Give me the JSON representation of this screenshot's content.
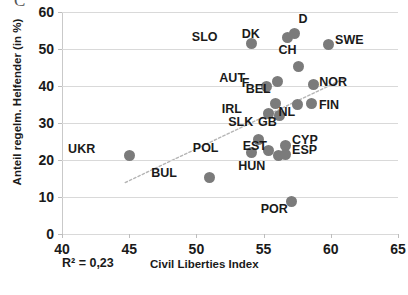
{
  "axes": {
    "y_title": "Anteil regelm. Helfender (in %)",
    "x_title": "Civil Liberties Index",
    "y_ticks": [
      "0",
      "10",
      "20",
      "30",
      "40",
      "50",
      "60"
    ],
    "x_ticks": [
      "40",
      "45",
      "50",
      "55",
      "60",
      "65"
    ]
  },
  "annotations": {
    "r2": "R² = 0,23"
  },
  "colors": {
    "marker": "#7b7b7b",
    "gridline": "#d9d9d9",
    "trendline": "#b5b5b5",
    "text": "#1a1a1a"
  },
  "chart_data": {
    "type": "scatter",
    "title": "",
    "xlabel": "Civil Liberties Index",
    "ylabel": "Anteil regelm. Helfender (in %)",
    "xlim": [
      40,
      65
    ],
    "ylim": [
      0,
      60
    ],
    "xticks": [
      40,
      45,
      50,
      55,
      60,
      65
    ],
    "yticks": [
      0,
      10,
      20,
      30,
      40,
      50,
      60
    ],
    "grid": "horizontal",
    "legend": "none",
    "annotations": [
      "R² = 0,23"
    ],
    "trendline": {
      "visible": true,
      "style": "dotted",
      "x_start": 44.7,
      "y_start": 13.9,
      "x_end": 61.0,
      "y_end": 42.0
    },
    "points": [
      {
        "label": "UKR",
        "x": 45.0,
        "y": 21.3,
        "label_dx": -34,
        "label_dy": -6
      },
      {
        "label": "BUL",
        "x": 51.0,
        "y": 15.3,
        "label_dx": -33,
        "label_dy": -4
      },
      {
        "label": "SLO",
        "x": 54.1,
        "y": 51.6,
        "label_dx": -34,
        "label_dy": -6
      },
      {
        "label": "POL",
        "x": 54.1,
        "y": 22.0,
        "label_dx": -33,
        "label_dy": -5
      },
      {
        "label": "SLK",
        "x": 54.6,
        "y": 25.5,
        "label_dx": -5,
        "label_dy": -18
      },
      {
        "label": "EST",
        "x": 55.4,
        "y": 22.5,
        "label_dx": -2,
        "label_dy": -5
      },
      {
        "label": "F",
        "x": 55.2,
        "y": 39.8,
        "label_dx": -17,
        "label_dy": -4
      },
      {
        "label": "IRL",
        "x": 55.4,
        "y": 32.7,
        "label_dx": -27,
        "label_dy": -4
      },
      {
        "label": "BEL",
        "x": 55.9,
        "y": 35.2,
        "label_dx": -5,
        "label_dy": -15
      },
      {
        "label": "AUT",
        "x": 56.0,
        "y": 41.2,
        "label_dx": -32,
        "label_dy": -4
      },
      {
        "label": "HUN",
        "x": 56.1,
        "y": 21.2,
        "label_dx": -13,
        "label_dy": 10
      },
      {
        "label": "CYP",
        "x": 56.6,
        "y": 24.0,
        "label_dx": 7,
        "label_dy": -5
      },
      {
        "label": "ESP",
        "x": 56.6,
        "y": 21.6,
        "label_dx": 7,
        "label_dy": -4
      },
      {
        "label": "DK",
        "x": 56.8,
        "y": 53.0,
        "label_dx": -28,
        "label_dy": -4
      },
      {
        "label": "D",
        "x": 57.3,
        "y": 54.3,
        "label_dx": 4,
        "label_dy": -14
      },
      {
        "label": "GB",
        "x": 56.2,
        "y": 32.0,
        "label_dx": -3,
        "label_dy": 6
      },
      {
        "label": "CH",
        "x": 57.6,
        "y": 45.2,
        "label_dx": -2,
        "label_dy": -17
      },
      {
        "label": "POR",
        "x": 57.1,
        "y": 8.9,
        "label_dx": -4,
        "label_dy": 8
      },
      {
        "label": "NL",
        "x": 57.5,
        "y": 35.0,
        "label_dx": -2,
        "label_dy": 7
      },
      {
        "label": "NOR",
        "x": 58.7,
        "y": 40.4,
        "label_dx": 6,
        "label_dy": -3
      },
      {
        "label": "FIN",
        "x": 58.6,
        "y": 35.3,
        "label_dx": 7,
        "label_dy": 2
      },
      {
        "label": "SWE",
        "x": 59.8,
        "y": 51.3,
        "label_dx": 7,
        "label_dy": -4
      }
    ]
  }
}
